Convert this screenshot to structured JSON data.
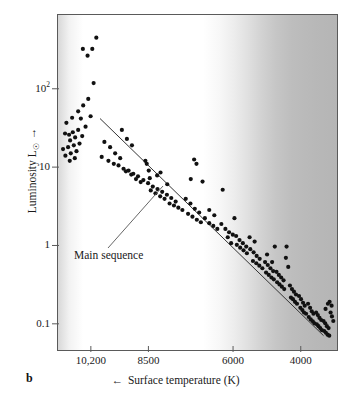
{
  "figure": {
    "panel_letter": "b",
    "annotation": {
      "label": "Main sequence",
      "leader_from": [
        108,
        248
      ],
      "leader_to": [
        163,
        186
      ]
    }
  },
  "chart_data": {
    "type": "scatter",
    "title": "",
    "xlabel": "Surface temperature (K)",
    "xlabel_arrow": "←",
    "ylabel": "Luminosity L",
    "ylabel_sub": "☉",
    "ylabel_arrow": "→",
    "xscale": "linear-reversed",
    "yscale": "log",
    "xticks": [
      10200,
      8500,
      6000,
      4000
    ],
    "xtick_labels": [
      "10,200",
      "8500",
      "6000",
      "4000"
    ],
    "yticks": [
      100,
      10,
      1,
      0.1
    ],
    "ytick_labels": [
      "10²",
      "10",
      "1",
      "0.1"
    ],
    "ytick_label_parts": [
      {
        "base": "10",
        "exp": "2"
      },
      {
        "base": "10",
        "exp": ""
      },
      {
        "base": "1",
        "exp": ""
      },
      {
        "base": "0.1",
        "exp": ""
      }
    ],
    "xlim": [
      11200,
      2900
    ],
    "ylim": [
      0.045,
      900
    ],
    "grid": false,
    "legend": null,
    "series_name": "Stars",
    "marker_color": "#111111",
    "marker_size_px": 4.2,
    "fit_line": {
      "name": "Main sequence",
      "x": [
        9950,
        3300
      ],
      "y": [
        42,
        0.068
      ],
      "color": "#333333"
    },
    "background_note": "Horizontal greyscale band: light at hot end, darkening toward cool end",
    "points": [
      [
        10060,
        460
      ],
      [
        10180,
        330
      ],
      [
        10320,
        270
      ],
      [
        10460,
        330
      ],
      [
        10140,
        120
      ],
      [
        10300,
        75
      ],
      [
        10450,
        62
      ],
      [
        10600,
        52
      ],
      [
        10230,
        45
      ],
      [
        10520,
        42
      ],
      [
        10780,
        43
      ],
      [
        10950,
        37
      ],
      [
        10380,
        33
      ],
      [
        10600,
        30
      ],
      [
        10760,
        28
      ],
      [
        10870,
        26
      ],
      [
        10480,
        25
      ],
      [
        10690,
        24
      ],
      [
        10840,
        22
      ],
      [
        10990,
        27
      ],
      [
        10560,
        20
      ],
      [
        10730,
        19
      ],
      [
        10900,
        18
      ],
      [
        11050,
        17
      ],
      [
        10650,
        16
      ],
      [
        10820,
        15
      ],
      [
        10980,
        14
      ],
      [
        9820,
        21
      ],
      [
        9650,
        18
      ],
      [
        9500,
        15
      ],
      [
        9350,
        13
      ],
      [
        9900,
        13.5
      ],
      [
        9700,
        12
      ],
      [
        9540,
        11
      ],
      [
        9400,
        10.5
      ],
      [
        9250,
        9.5
      ],
      [
        9100,
        9.0
      ],
      [
        8960,
        8.2
      ],
      [
        8820,
        7.6
      ],
      [
        9180,
        8.8
      ],
      [
        9020,
        8.0
      ],
      [
        8880,
        7.0
      ],
      [
        8740,
        6.4
      ],
      [
        8600,
        12.0
      ],
      [
        8560,
        11.0
      ],
      [
        8500,
        9.0
      ],
      [
        8470,
        7.2
      ],
      [
        8660,
        6.8
      ],
      [
        8520,
        6.2
      ],
      [
        8380,
        5.6
      ],
      [
        8240,
        5.2
      ],
      [
        8440,
        5.0
      ],
      [
        8300,
        4.6
      ],
      [
        8160,
        4.2
      ],
      [
        8030,
        3.9
      ],
      [
        8100,
        4.8
      ],
      [
        7960,
        4.4
      ],
      [
        7830,
        4.0
      ],
      [
        7700,
        3.6
      ],
      [
        7880,
        3.4
      ],
      [
        7750,
        3.2
      ],
      [
        7620,
        3.0
      ],
      [
        7500,
        2.8
      ],
      [
        7400,
        3.9
      ],
      [
        7260,
        3.4
      ],
      [
        7130,
        2.9
      ],
      [
        7000,
        2.6
      ],
      [
        7330,
        2.5
      ],
      [
        7200,
        2.3
      ],
      [
        7070,
        2.1
      ],
      [
        6950,
        1.95
      ],
      [
        6830,
        2.2
      ],
      [
        6700,
        1.9
      ],
      [
        6580,
        1.75
      ],
      [
        6460,
        1.6
      ],
      [
        6340,
        1.85
      ],
      [
        6220,
        1.6
      ],
      [
        6110,
        1.45
      ],
      [
        6000,
        1.35
      ],
      [
        6300,
        5.1
      ],
      [
        6550,
        2.4
      ],
      [
        6700,
        2.8
      ],
      [
        5900,
        1.3
      ],
      [
        5800,
        1.15
      ],
      [
        5700,
        1.05
      ],
      [
        5600,
        0.95
      ],
      [
        5880,
        1.0
      ],
      [
        5780,
        0.92
      ],
      [
        5680,
        0.85
      ],
      [
        5580,
        0.78
      ],
      [
        5480,
        0.88
      ],
      [
        5380,
        0.8
      ],
      [
        5290,
        0.72
      ],
      [
        5200,
        0.66
      ],
      [
        5400,
        0.62
      ],
      [
        5300,
        0.58
      ],
      [
        5210,
        0.54
      ],
      [
        5120,
        0.5
      ],
      [
        5040,
        0.6
      ],
      [
        4960,
        0.55
      ],
      [
        4880,
        0.5
      ],
      [
        4800,
        0.46
      ],
      [
        5010,
        0.44
      ],
      [
        4930,
        0.41
      ],
      [
        4850,
        0.38
      ],
      [
        4780,
        0.36
      ],
      [
        4700,
        0.45
      ],
      [
        4630,
        0.41
      ],
      [
        4560,
        0.38
      ],
      [
        4490,
        0.35
      ],
      [
        4680,
        0.33
      ],
      [
        4610,
        0.31
      ],
      [
        4540,
        0.29
      ],
      [
        4470,
        0.27
      ],
      [
        4400,
        0.95
      ],
      [
        4420,
        0.68
      ],
      [
        4350,
        0.52
      ],
      [
        4300,
        0.3
      ],
      [
        4240,
        0.27
      ],
      [
        4180,
        0.25
      ],
      [
        4120,
        0.23
      ],
      [
        4270,
        0.21
      ],
      [
        4210,
        0.2
      ],
      [
        4150,
        0.185
      ],
      [
        4090,
        0.175
      ],
      [
        4030,
        0.22
      ],
      [
        3970,
        0.2
      ],
      [
        3910,
        0.18
      ],
      [
        3860,
        0.165
      ],
      [
        3990,
        0.155
      ],
      [
        3930,
        0.145
      ],
      [
        3880,
        0.135
      ],
      [
        3820,
        0.13
      ],
      [
        3760,
        0.175
      ],
      [
        3700,
        0.155
      ],
      [
        3650,
        0.14
      ],
      [
        3600,
        0.13
      ],
      [
        3740,
        0.118
      ],
      [
        3680,
        0.11
      ],
      [
        3620,
        0.104
      ],
      [
        3570,
        0.098
      ],
      [
        3520,
        0.135
      ],
      [
        3470,
        0.125
      ],
      [
        3420,
        0.115
      ],
      [
        3370,
        0.108
      ],
      [
        3500,
        0.095
      ],
      [
        3450,
        0.09
      ],
      [
        3400,
        0.085
      ],
      [
        3350,
        0.08
      ],
      [
        3300,
        0.105
      ],
      [
        3250,
        0.098
      ],
      [
        3200,
        0.09
      ],
      [
        3150,
        0.085
      ],
      [
        3280,
        0.078
      ],
      [
        3230,
        0.074
      ],
      [
        3180,
        0.07
      ],
      [
        3130,
        0.068
      ],
      [
        3090,
        0.135
      ],
      [
        3050,
        0.12
      ],
      [
        3010,
        0.105
      ],
      [
        3060,
        0.165
      ],
      [
        3120,
        0.185
      ],
      [
        3170,
        0.175
      ],
      [
        3240,
        0.15
      ],
      [
        6900,
        6.5
      ],
      [
        7150,
        12.5
      ],
      [
        7080,
        11.0
      ],
      [
        7250,
        7.0
      ],
      [
        6050,
        1.05
      ],
      [
        6150,
        1.25
      ],
      [
        5950,
        2.2
      ],
      [
        4750,
        0.95
      ],
      [
        4830,
        0.6
      ],
      [
        4980,
        0.75
      ],
      [
        5500,
        1.25
      ],
      [
        5350,
        1.1
      ],
      [
        8150,
        8.5
      ],
      [
        8250,
        7.8
      ],
      [
        7950,
        6.0
      ],
      [
        9300,
        30
      ],
      [
        9150,
        23
      ],
      [
        9000,
        19
      ],
      [
        10700,
        13.0
      ],
      [
        10850,
        12.0
      ]
    ]
  }
}
